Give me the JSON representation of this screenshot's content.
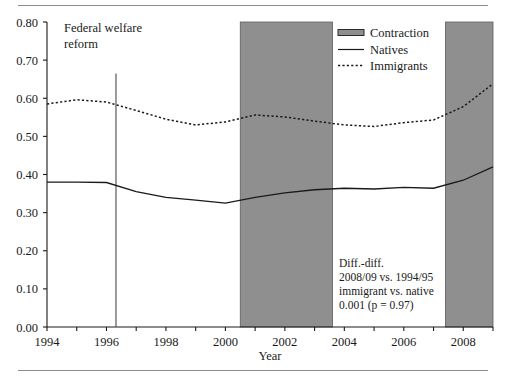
{
  "chart_data": {
    "type": "line",
    "title": "",
    "xlabel": "Year",
    "ylabel": "",
    "xlim": [
      1994,
      2009
    ],
    "ylim": [
      0.0,
      0.8
    ],
    "grid": false,
    "legend_position": "top-right",
    "x_ticks": [
      1994,
      1995,
      1996,
      1997,
      1998,
      1999,
      2000,
      2001,
      2002,
      2003,
      2004,
      2005,
      2006,
      2007,
      2008,
      2009
    ],
    "x_tick_labels": [
      "1994",
      "",
      "1996",
      "",
      "1998",
      "",
      "2000",
      "",
      "2002",
      "",
      "2004",
      "",
      "2006",
      "",
      "2008",
      ""
    ],
    "y_ticks": [
      0.0,
      0.1,
      0.2,
      0.3,
      0.4,
      0.5,
      0.6,
      0.7,
      0.8
    ],
    "y_tick_labels": [
      "0.00",
      "0.10",
      "0.20",
      "0.30",
      "0.40",
      "0.50",
      "0.60",
      "0.70",
      "0.80"
    ],
    "x": [
      1994,
      1995,
      1996,
      1997,
      1998,
      1999,
      2000,
      2001,
      2002,
      2003,
      2004,
      2005,
      2006,
      2007,
      2008,
      2009
    ],
    "series": [
      {
        "name": "Natives",
        "style": "solid",
        "color": "#1a1a1a",
        "values": [
          0.38,
          0.38,
          0.379,
          0.355,
          0.34,
          0.333,
          0.325,
          0.34,
          0.352,
          0.36,
          0.364,
          0.362,
          0.366,
          0.364,
          0.385,
          0.42
        ]
      },
      {
        "name": "Immigrants",
        "style": "dotted",
        "color": "#1a1a1a",
        "values": [
          0.585,
          0.596,
          0.59,
          0.568,
          0.545,
          0.53,
          0.538,
          0.556,
          0.551,
          0.54,
          0.53,
          0.526,
          0.536,
          0.543,
          0.578,
          0.638
        ]
      }
    ],
    "bands": [
      {
        "name": "Contraction",
        "start": 2000.5,
        "end": 2003.6,
        "color": "#8f8f8f"
      },
      {
        "name": "Contraction",
        "start": 2007.4,
        "end": 2009.0,
        "color": "#8f8f8f"
      }
    ],
    "vertical_markers": [
      {
        "label": "Federal welfare reform",
        "x": 1996.32,
        "y_top": 0.665,
        "y_bottom": 0.0
      }
    ],
    "annotations": [
      {
        "name": "federal-welfare-reform",
        "lines": [
          "Federal welfare",
          "reform"
        ],
        "x": 1996.0,
        "y": 0.78
      },
      {
        "name": "diff-in-diff",
        "lines": [
          "Diff.-diff.",
          "2008/09 vs. 1994/95",
          "immigrant vs. native",
          "0.001 (p = 0.97)"
        ],
        "x": 2003.9,
        "y": 0.195
      }
    ],
    "legend": [
      {
        "label": "Contraction",
        "marker": "band-swatch"
      },
      {
        "label": "Natives",
        "marker": "solid-line"
      },
      {
        "label": "Immigrants",
        "marker": "dotted-line"
      }
    ]
  },
  "axis": {
    "x_title": "Year",
    "y_labels": [
      "0.80",
      "0.70",
      "0.60",
      "0.50",
      "0.40",
      "0.30",
      "0.20",
      "0.10",
      "0.00"
    ],
    "x_labels": [
      "1994",
      "1996",
      "1998",
      "2000",
      "2002",
      "2004",
      "2006",
      "2008"
    ]
  },
  "legend": {
    "items": [
      {
        "label": "Contraction"
      },
      {
        "label": "Natives"
      },
      {
        "label": "Immigrants"
      }
    ]
  },
  "annotations": {
    "welfare": {
      "line1": "Federal welfare",
      "line2": "reform"
    },
    "diffdiff": {
      "line1": "Diff.-diff.",
      "line2": "2008/09 vs. 1994/95",
      "line3": "immigrant vs. native",
      "line4": "0.001 (p = 0.97)"
    }
  },
  "colors": {
    "band": "#8f8f8f",
    "line": "#1a1a1a",
    "rule": "#8d8d8d"
  }
}
